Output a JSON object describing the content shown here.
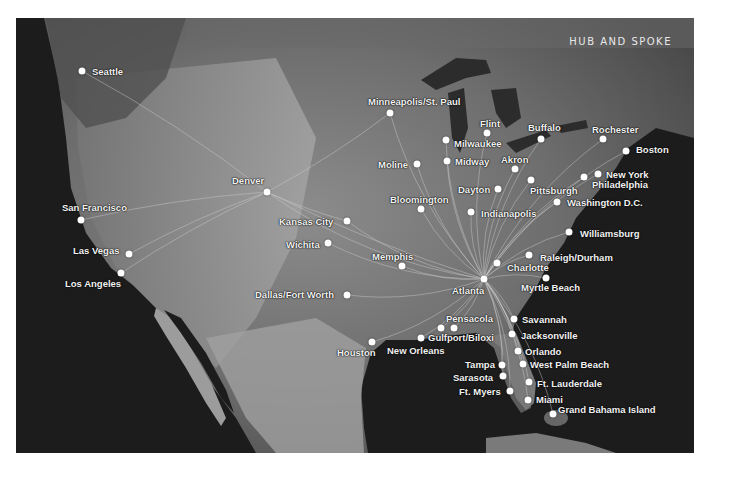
{
  "title": "Hub and Spoke",
  "colors": {
    "ocean": "#1b1b1b",
    "land_light": "#9a9a9a",
    "land_dark": "#555555",
    "dot": "#ffffff",
    "route": "#cfcfcf",
    "label": "#f2f2f2"
  },
  "hubs": [
    {
      "name": "Denver",
      "x": 267,
      "y": 192
    },
    {
      "name": "Atlanta",
      "x": 484,
      "y": 279
    }
  ],
  "cities": [
    {
      "name": "Seattle",
      "x": 82,
      "y": 71,
      "lx": 92,
      "ly": 66,
      "align": "left"
    },
    {
      "name": "Minneapolis/St. Paul",
      "x": 390,
      "y": 113,
      "lx": 368,
      "ly": 96,
      "align": "left"
    },
    {
      "name": "Flint",
      "x": 487,
      "y": 133,
      "lx": 480,
      "ly": 118,
      "align": "left"
    },
    {
      "name": "Milwaukee",
      "x": 446,
      "y": 140,
      "lx": 454,
      "ly": 138,
      "align": "left"
    },
    {
      "name": "Buffalo",
      "x": 541,
      "y": 139,
      "lx": 528,
      "ly": 122,
      "align": "left"
    },
    {
      "name": "Rochester",
      "x": 603,
      "y": 139,
      "lx": 592,
      "ly": 124,
      "align": "left"
    },
    {
      "name": "Boston",
      "x": 626,
      "y": 151,
      "lx": 636,
      "ly": 144,
      "align": "left"
    },
    {
      "name": "Moline",
      "x": 417,
      "y": 164,
      "lx": 378,
      "ly": 159,
      "align": "left"
    },
    {
      "name": "Midway",
      "x": 447,
      "y": 161,
      "lx": 455,
      "ly": 156,
      "align": "left"
    },
    {
      "name": "Akron",
      "x": 515,
      "y": 169,
      "lx": 501,
      "ly": 154,
      "align": "left"
    },
    {
      "name": "New York",
      "x": 598,
      "y": 174,
      "lx": 606,
      "ly": 169,
      "align": "left"
    },
    {
      "name": "Philadelphia",
      "x": 584,
      "y": 177,
      "lx": 592,
      "ly": 179,
      "align": "left"
    },
    {
      "name": "Pittsburgh",
      "x": 531,
      "y": 180,
      "lx": 530,
      "ly": 185,
      "align": "left"
    },
    {
      "name": "Dayton",
      "x": 498,
      "y": 189,
      "lx": 458,
      "ly": 184,
      "align": "left"
    },
    {
      "name": "Denver",
      "x": 267,
      "y": 192,
      "lx": 232,
      "ly": 175,
      "align": "left"
    },
    {
      "name": "Washington D.C.",
      "x": 557,
      "y": 202,
      "lx": 567,
      "ly": 197,
      "align": "left"
    },
    {
      "name": "Bloomington",
      "x": 421,
      "y": 209,
      "lx": 390,
      "ly": 194,
      "align": "left"
    },
    {
      "name": "Indianapolis",
      "x": 471,
      "y": 212,
      "lx": 481,
      "ly": 208,
      "align": "left"
    },
    {
      "name": "San Francisco",
      "x": 81,
      "y": 220,
      "lx": 62,
      "ly": 202,
      "align": "left"
    },
    {
      "name": "Kansas City",
      "x": 347,
      "y": 221,
      "lx": 279,
      "ly": 216,
      "align": "left"
    },
    {
      "name": "Williamsburg",
      "x": 569,
      "y": 232,
      "lx": 580,
      "ly": 228,
      "align": "left"
    },
    {
      "name": "Wichita",
      "x": 328,
      "y": 243,
      "lx": 286,
      "ly": 239,
      "align": "left"
    },
    {
      "name": "Las Vegas",
      "x": 129,
      "y": 254,
      "lx": 73,
      "ly": 245,
      "align": "left"
    },
    {
      "name": "Raleigh/Durham",
      "x": 529,
      "y": 255,
      "lx": 540,
      "ly": 252,
      "align": "left"
    },
    {
      "name": "Memphis",
      "x": 402,
      "y": 266,
      "lx": 372,
      "ly": 251,
      "align": "left"
    },
    {
      "name": "Charlotte",
      "x": 497,
      "y": 263,
      "lx": 507,
      "ly": 262,
      "align": "left"
    },
    {
      "name": "Los Angeles",
      "x": 121,
      "y": 273,
      "lx": 65,
      "ly": 278,
      "align": "left"
    },
    {
      "name": "Atlanta",
      "x": 484,
      "y": 279,
      "lx": 452,
      "ly": 285,
      "align": "left"
    },
    {
      "name": "Myrtle Beach",
      "x": 546,
      "y": 278,
      "lx": 521,
      "ly": 282,
      "align": "left"
    },
    {
      "name": "Dallas/Fort Worth",
      "x": 347,
      "y": 295,
      "lx": 255,
      "ly": 289,
      "align": "left"
    },
    {
      "name": "Savannah",
      "x": 514,
      "y": 319,
      "lx": 522,
      "ly": 314,
      "align": "left"
    },
    {
      "name": "Pensacola",
      "x": 454,
      "y": 328,
      "lx": 446,
      "ly": 313,
      "align": "left"
    },
    {
      "name": "Gulfport/Biloxi",
      "x": 441,
      "y": 328,
      "lx": 428,
      "ly": 332,
      "align": "left"
    },
    {
      "name": "Jacksonville",
      "x": 512,
      "y": 334,
      "lx": 521,
      "ly": 330,
      "align": "left"
    },
    {
      "name": "New Orleans",
      "x": 421,
      "y": 338,
      "lx": 387,
      "ly": 345,
      "align": "left"
    },
    {
      "name": "Houston",
      "x": 372,
      "y": 342,
      "lx": 337,
      "ly": 347,
      "align": "left"
    },
    {
      "name": "Orlando",
      "x": 518,
      "y": 351,
      "lx": 525,
      "ly": 346,
      "align": "left"
    },
    {
      "name": "Tampa",
      "x": 502,
      "y": 365,
      "lx": 465,
      "ly": 359,
      "align": "left"
    },
    {
      "name": "West Palm Beach",
      "x": 523,
      "y": 364,
      "lx": 530,
      "ly": 359,
      "align": "left"
    },
    {
      "name": "Sarasota",
      "x": 503,
      "y": 376,
      "lx": 453,
      "ly": 372,
      "align": "left"
    },
    {
      "name": "Ft. Lauderdale",
      "x": 529,
      "y": 382,
      "lx": 537,
      "ly": 378,
      "align": "left"
    },
    {
      "name": "Ft. Myers",
      "x": 510,
      "y": 391,
      "lx": 459,
      "ly": 386,
      "align": "left"
    },
    {
      "name": "Miami",
      "x": 528,
      "y": 400,
      "lx": 536,
      "ly": 394,
      "align": "left"
    },
    {
      "name": "Grand Bahama Island",
      "x": 553,
      "y": 414,
      "lx": 558,
      "ly": 404,
      "align": "left"
    }
  ],
  "routes_from_denver": [
    "Seattle",
    "San Francisco",
    "Las Vegas",
    "Los Angeles",
    "Minneapolis/St. Paul",
    "Kansas City",
    "Atlanta"
  ],
  "routes_from_atlanta": [
    "Minneapolis/St. Paul",
    "Flint",
    "Milwaukee",
    "Buffalo",
    "Rochester",
    "Boston",
    "Moline",
    "Midway",
    "Akron",
    "New York",
    "Philadelphia",
    "Pittsburgh",
    "Dayton",
    "Washington D.C.",
    "Bloomington",
    "Indianapolis",
    "Kansas City",
    "Williamsburg",
    "Wichita",
    "Raleigh/Durham",
    "Memphis",
    "Charlotte",
    "Myrtle Beach",
    "Dallas/Fort Worth",
    "Savannah",
    "Pensacola",
    "Gulfport/Biloxi",
    "Jacksonville",
    "New Orleans",
    "Houston",
    "Orlando",
    "Tampa",
    "West Palm Beach",
    "Sarasota",
    "Ft. Lauderdale",
    "Ft. Myers",
    "Miami",
    "Grand Bahama Island",
    "Denver"
  ]
}
